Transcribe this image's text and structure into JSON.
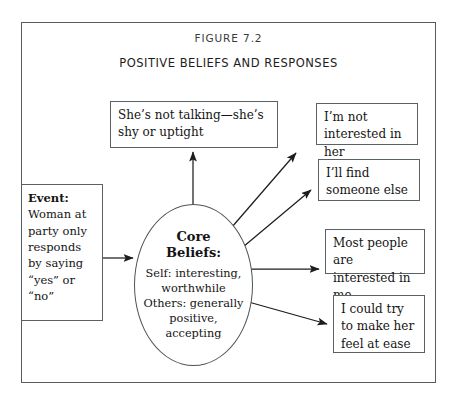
{
  "figure": {
    "label": "FIGURE 7.2",
    "title": "POSITIVE BELIEFS AND RESPONSES"
  },
  "event_box": {
    "heading": "Event:",
    "body": "Woman at party only responds by saying “yes” or “no”"
  },
  "core_beliefs": {
    "title_line1": "Core",
    "title_line2": "Beliefs:",
    "line1": "Self: interesting,",
    "line2": "worthwhile",
    "line3": "Others: generally",
    "line4": "positive,",
    "line5": "accepting"
  },
  "thought_box": {
    "text": "She’s not talking—she’s shy or uptight"
  },
  "responses": [
    {
      "text": "I’m not interested in her"
    },
    {
      "text": "I’ll find someone else"
    },
    {
      "text": "Most people are interested in me"
    },
    {
      "text": "I could try to make her feel at ease"
    }
  ],
  "arrows": [
    {
      "name": "event-to-core"
    },
    {
      "name": "core-to-thought"
    },
    {
      "name": "core-to-response-1"
    },
    {
      "name": "core-to-response-2"
    },
    {
      "name": "core-to-response-3"
    },
    {
      "name": "core-to-response-4"
    }
  ],
  "colors": {
    "stroke": "#5a6164",
    "text": "#141414",
    "background": "#ffffff"
  }
}
